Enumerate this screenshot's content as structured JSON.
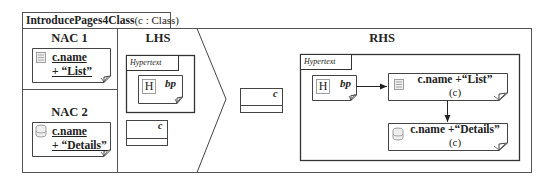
{
  "rule": {
    "name": "IntroducePages4Class",
    "params": "(c : Class)"
  },
  "nac1": {
    "title": "NAC 1",
    "page": {
      "icon": "list-page-icon",
      "line1": "c.name",
      "line2": "+ “List”"
    }
  },
  "nac2": {
    "title": "NAC 2",
    "page": {
      "icon": "data-page-icon",
      "line1": "c.name",
      "line2": "+ “Details”"
    }
  },
  "lhs": {
    "title": "LHS",
    "hypertext_label": "Hypertext",
    "home_page": {
      "icon_letter": "H",
      "name": "bp"
    },
    "class_node": {
      "name": "c"
    }
  },
  "middle": {
    "class_node": {
      "name": "c"
    }
  },
  "rhs": {
    "title": "RHS",
    "hypertext_label": "Hypertext",
    "home_page": {
      "icon_letter": "H",
      "name": "bp"
    },
    "list_page": {
      "icon": "list-page-icon",
      "name": "c.name +“List”",
      "param": "(c)"
    },
    "details_page": {
      "icon": "data-page-icon",
      "name": "c.name +“Details”",
      "param": "(c)"
    }
  },
  "colors": {
    "line": "#333333",
    "frame": "#555555",
    "icon": "#888888"
  }
}
